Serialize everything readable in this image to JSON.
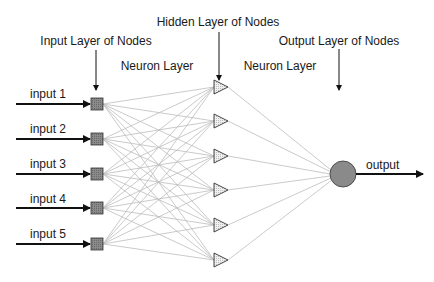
{
  "diagram": {
    "labels": {
      "hidden_layer": "Hidden Layer of Nodes",
      "input_layer": "Input Layer of Nodes",
      "output_layer": "Output Layer of Nodes",
      "neuron_layer_left": "Neuron Layer",
      "neuron_layer_right": "Neuron Layer"
    },
    "inputs": [
      {
        "label": "input 1"
      },
      {
        "label": "input 2"
      },
      {
        "label": "input 3"
      },
      {
        "label": "input 4"
      },
      {
        "label": "input 5"
      }
    ],
    "hidden_nodes": 6,
    "output": {
      "label": "output"
    },
    "colors": {
      "node_fill": "#808080",
      "connection": "#b8b8b8",
      "stroke": "#333333"
    }
  }
}
